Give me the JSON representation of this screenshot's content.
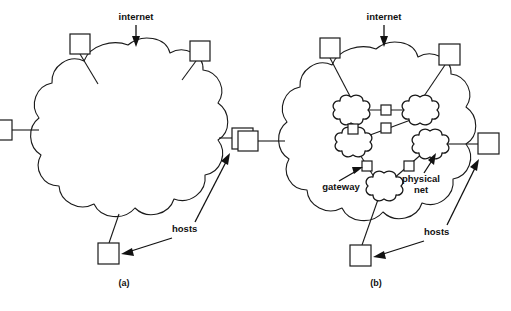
{
  "figure": {
    "background_color": "#ffffff",
    "line_color": "#1a1a1a",
    "width": 511,
    "height": 311
  },
  "panel_a": {
    "caption": "(a)",
    "internet_label": "internet",
    "hosts_label": "hosts",
    "host_count": 5,
    "description": "internet shown as a single cloud with five attached hosts"
  },
  "panel_b": {
    "caption": "(b)",
    "internet_label": "internet",
    "hosts_label": "hosts",
    "gateway_label": "gateway",
    "physical_net_label_line1": "physical",
    "physical_net_label_line2": "net",
    "host_count": 5,
    "physical_net_count": 5,
    "gateway_count": 6,
    "description": "internet cloud expanded to show physical nets interconnected by gateways"
  }
}
